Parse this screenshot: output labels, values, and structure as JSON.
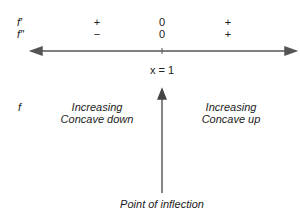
{
  "rows": {
    "f_prime": {
      "label": "f′",
      "left": "+",
      "center": "0",
      "right": "+"
    },
    "f_double_prime": {
      "label": "f″",
      "left": "−",
      "center": "0",
      "right": "+"
    }
  },
  "axis": {
    "point_label": "x = 1"
  },
  "function_row": {
    "label": "f",
    "left_line1": "Increasing",
    "left_line2": "Concave down",
    "right_line1": "Increasing",
    "right_line2": "Concave up"
  },
  "annotation": {
    "label": "Point of inflection"
  }
}
